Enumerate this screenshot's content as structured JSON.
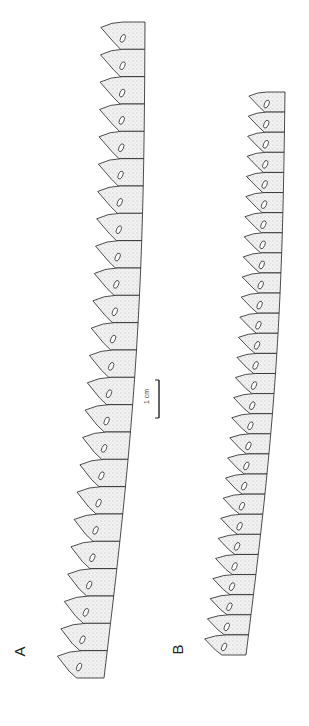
{
  "figure": {
    "panels": [
      {
        "label": "A",
        "subject": "vertebral-column-illustration",
        "vertebrae_count": 24
      },
      {
        "label": "B",
        "subject": "vertebral-column-illustration",
        "vertebrae_count": 28
      }
    ],
    "scale_bar": {
      "label": "1 cm"
    },
    "colors": {
      "ink": "#222222",
      "stipple": "#9a9a9a",
      "fill": "#ececec",
      "background": "#ffffff"
    }
  }
}
